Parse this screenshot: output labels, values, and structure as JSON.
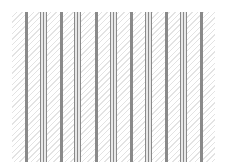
{
  "pattern": {
    "background": "diagonal-hatch",
    "line_color": "#8a8a8a",
    "hatch_color": "#e3e3e3",
    "groups": [
      {
        "type": "single",
        "x": 13
      },
      {
        "type": "triple",
        "x": 28
      },
      {
        "type": "single",
        "x": 48
      },
      {
        "type": "triple",
        "x": 62
      },
      {
        "type": "single",
        "x": 83
      },
      {
        "type": "triple",
        "x": 98
      },
      {
        "type": "single",
        "x": 118
      },
      {
        "type": "triple",
        "x": 133
      },
      {
        "type": "single",
        "x": 153
      },
      {
        "type": "triple",
        "x": 168
      },
      {
        "type": "single",
        "x": 188
      }
    ]
  }
}
